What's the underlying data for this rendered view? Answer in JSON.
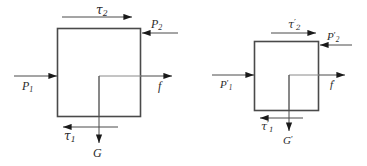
{
  "figure": {
    "type": "free-body-diagram-pair",
    "background_color": "#ffffff",
    "line_color": "#4a4a4a",
    "arrow_color": "#1a1a1a",
    "text_color": "#2b2b2b"
  },
  "diagrams": [
    {
      "id": "left-diagram",
      "name": "unprimed-free-body-diagram",
      "box": {
        "x": 57,
        "y": 28,
        "width": 83,
        "height": 88
      },
      "forces": [
        {
          "key": "tau2",
          "label": "τ",
          "subscript": "2",
          "prime": "",
          "direction": "right",
          "position": "above-top-edge",
          "line": {
            "x1": 62,
            "y1": 17,
            "x2": 132,
            "y2": 17
          },
          "label_pos": {
            "x": 96,
            "y": 4
          }
        },
        {
          "key": "P2",
          "label": "P",
          "subscript": "2",
          "prime": "",
          "direction": "left",
          "position": "into-right-edge-top",
          "line": {
            "x1": 178,
            "y1": 33,
            "x2": 141,
            "y2": 33
          },
          "label_pos": {
            "x": 151,
            "y": 18
          }
        },
        {
          "key": "P1",
          "label": "P",
          "subscript": "1",
          "prime": "",
          "direction": "right",
          "position": "into-left-edge-middle",
          "line": {
            "x1": 14,
            "y1": 76,
            "x2": 56,
            "y2": 76
          },
          "label_pos": {
            "x": 22,
            "y": 80
          }
        },
        {
          "key": "f",
          "label": "f",
          "subscript": "",
          "prime": "",
          "direction": "right",
          "position": "out-of-right-edge-middle",
          "line": {
            "x1": 141,
            "y1": 76,
            "x2": 172,
            "y2": 76
          },
          "label_pos": {
            "x": 158,
            "y": 80
          }
        },
        {
          "key": "tau1",
          "label": "τ",
          "subscript": "1",
          "prime": "",
          "direction": "left",
          "position": "below-bottom-edge",
          "line": {
            "x1": 118,
            "y1": 127,
            "x2": 62,
            "y2": 127
          },
          "label_pos": {
            "x": 64,
            "y": 130
          }
        },
        {
          "key": "G",
          "label": "G",
          "subscript": "",
          "prime": "",
          "direction": "down",
          "position": "below-center",
          "line": {
            "x1": 99,
            "y1": 76,
            "x2": 99,
            "y2": 143
          },
          "label_pos": {
            "x": 93,
            "y": 147
          }
        }
      ],
      "inner_lines": [
        {
          "x1": 99,
          "y1": 76,
          "x2": 141,
          "y2": 76
        },
        {
          "x1": 99,
          "y1": 76,
          "x2": 99,
          "y2": 116
        }
      ]
    },
    {
      "id": "right-diagram",
      "name": "primed-free-body-diagram",
      "box": {
        "x": 254,
        "y": 41,
        "width": 64,
        "height": 69
      },
      "forces": [
        {
          "key": "tau2p",
          "label": "τ",
          "subscript": "2",
          "prime": "′",
          "direction": "right",
          "position": "above-top-edge",
          "line": {
            "x1": 271,
            "y1": 33,
            "x2": 316,
            "y2": 33
          },
          "label_pos": {
            "x": 288,
            "y": 19
          }
        },
        {
          "key": "P2p",
          "label": "P",
          "subscript": "2",
          "prime": "′",
          "direction": "left",
          "position": "into-right-edge-top",
          "line": {
            "x1": 352,
            "y1": 45,
            "x2": 319,
            "y2": 45
          },
          "label_pos": {
            "x": 327,
            "y": 31
          }
        },
        {
          "key": "P1p",
          "label": "P",
          "subscript": "1",
          "prime": "′",
          "direction": "right",
          "position": "into-left-edge-middle",
          "line": {
            "x1": 212,
            "y1": 75,
            "x2": 253,
            "y2": 75
          },
          "label_pos": {
            "x": 220,
            "y": 79
          }
        },
        {
          "key": "fp",
          "label": "f",
          "subscript": "",
          "prime": "′",
          "direction": "right",
          "position": "out-of-right-edge-middle",
          "line": {
            "x1": 319,
            "y1": 75,
            "x2": 345,
            "y2": 75
          },
          "label_pos": {
            "x": 330,
            "y": 79
          }
        },
        {
          "key": "tau1p",
          "label": "τ",
          "subscript": "1",
          "prime": "′",
          "direction": "left",
          "position": "below-bottom-edge",
          "line": {
            "x1": 303,
            "y1": 118,
            "x2": 259,
            "y2": 118
          },
          "label_pos": {
            "x": 261,
            "y": 121
          }
        },
        {
          "key": "Gp",
          "label": "G",
          "subscript": "",
          "prime": "′",
          "direction": "down",
          "position": "below-center",
          "line": {
            "x1": 289,
            "y1": 75,
            "x2": 289,
            "y2": 131
          },
          "label_pos": {
            "x": 283,
            "y": 135
          }
        }
      ],
      "inner_lines": [
        {
          "x1": 289,
          "y1": 75,
          "x2": 319,
          "y2": 75
        },
        {
          "x1": 289,
          "y1": 75,
          "x2": 289,
          "y2": 110
        }
      ]
    }
  ]
}
